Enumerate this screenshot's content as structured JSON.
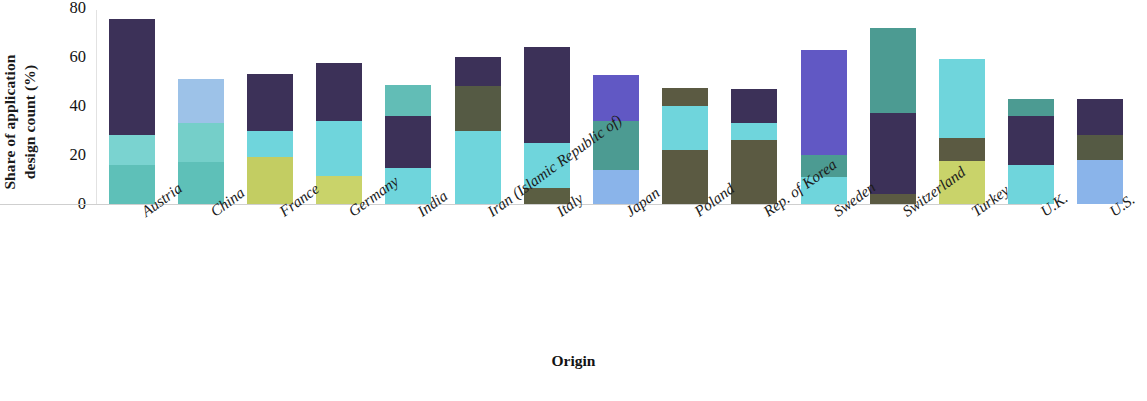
{
  "chart_data": {
    "type": "bar",
    "stacked": true,
    "title": "",
    "subtitle": "",
    "xlabel": "Origin",
    "ylabel": "Share of application design count (%)",
    "ylabel_line1": "Share of application",
    "ylabel_line2": "design count (%)",
    "ylim": [
      0,
      80
    ],
    "yticks": [
      0,
      20,
      40,
      60,
      80
    ],
    "ytick_labels": [
      "0",
      "20",
      "40",
      "60",
      "80"
    ],
    "grid": false,
    "legend": "none",
    "orientation": "vertical",
    "categories": [
      "Austria",
      "China",
      "France",
      "Germany",
      "India",
      "Iran (Islamic Republic of)",
      "Italy",
      "Japan",
      "Poland",
      "Rep. of Korea",
      "Sweden",
      "Switzerland",
      "Turkey",
      "U.K.",
      "U.S."
    ],
    "totals": [
      75.5,
      51.0,
      53.0,
      57.5,
      48.5,
      60.0,
      64.0,
      52.5,
      47.5,
      47.0,
      63.0,
      72.0,
      59.0,
      43.0,
      43.0
    ],
    "note": "Each origin shows three stacked class segments, listed bottom-to-top with their colors.",
    "bars": [
      {
        "category": "Austria",
        "total": 75.5,
        "segments": [
          {
            "value": 16.0,
            "color": "#5ec0b8",
            "order": "bottom"
          },
          {
            "value": 12.0,
            "color": "#7ad3d0",
            "order": "middle"
          },
          {
            "value": 47.5,
            "color": "#3c3158",
            "order": "top"
          }
        ]
      },
      {
        "category": "China",
        "total": 51.0,
        "segments": [
          {
            "value": 17.0,
            "color": "#5ec0b8",
            "order": "bottom"
          },
          {
            "value": 16.0,
            "color": "#75cfc9",
            "order": "middle"
          },
          {
            "value": 18.0,
            "color": "#9dc2e8",
            "order": "top"
          }
        ]
      },
      {
        "category": "France",
        "total": 53.0,
        "segments": [
          {
            "value": 19.0,
            "color": "#c3cd62",
            "order": "bottom"
          },
          {
            "value": 11.0,
            "color": "#6fd5dc",
            "order": "middle"
          },
          {
            "value": 23.0,
            "color": "#3c3158",
            "order": "top"
          }
        ]
      },
      {
        "category": "Germany",
        "total": 57.5,
        "segments": [
          {
            "value": 11.5,
            "color": "#c9d36a",
            "order": "bottom"
          },
          {
            "value": 22.5,
            "color": "#6fd5dc",
            "order": "middle"
          },
          {
            "value": 23.5,
            "color": "#3c3158",
            "order": "top"
          }
        ]
      },
      {
        "category": "India",
        "total": 48.5,
        "segments": [
          {
            "value": 14.5,
            "color": "#6fd5dc",
            "order": "bottom"
          },
          {
            "value": 21.5,
            "color": "#3c3158",
            "order": "middle"
          },
          {
            "value": 12.5,
            "color": "#62bdb6",
            "order": "top"
          }
        ]
      },
      {
        "category": "Iran (Islamic Republic of)",
        "total": 60.0,
        "segments": [
          {
            "value": 30.0,
            "color": "#6fd5dc",
            "order": "bottom"
          },
          {
            "value": 18.0,
            "color": "#555a44",
            "order": "middle"
          },
          {
            "value": 12.0,
            "color": "#3c3158",
            "order": "top"
          }
        ]
      },
      {
        "category": "Italy",
        "total": 64.0,
        "segments": [
          {
            "value": 6.5,
            "color": "#5b5e42",
            "order": "bottom"
          },
          {
            "value": 18.5,
            "color": "#6fd5dc",
            "order": "middle"
          },
          {
            "value": 39.0,
            "color": "#3c3158",
            "order": "top"
          }
        ]
      },
      {
        "category": "Japan",
        "total": 52.5,
        "segments": [
          {
            "value": 14.0,
            "color": "#8ab4ea",
            "order": "bottom"
          },
          {
            "value": 20.0,
            "color": "#4c9b92",
            "order": "middle"
          },
          {
            "value": 18.5,
            "color": "#6158c4",
            "order": "top"
          }
        ]
      },
      {
        "category": "Poland",
        "total": 47.5,
        "segments": [
          {
            "value": 22.0,
            "color": "#5b5a42",
            "order": "bottom"
          },
          {
            "value": 18.0,
            "color": "#6fd5dc",
            "order": "middle"
          },
          {
            "value": 7.5,
            "color": "#5b5a42",
            "order": "top"
          }
        ]
      },
      {
        "category": "Rep. of Korea",
        "total": 47.0,
        "segments": [
          {
            "value": 26.0,
            "color": "#5b5a42",
            "order": "bottom"
          },
          {
            "value": 7.0,
            "color": "#6fd5dc",
            "order": "middle"
          },
          {
            "value": 14.0,
            "color": "#3c3158",
            "order": "top"
          }
        ]
      },
      {
        "category": "Sweden",
        "total": 63.0,
        "segments": [
          {
            "value": 11.0,
            "color": "#6fd5dc",
            "order": "bottom"
          },
          {
            "value": 9.0,
            "color": "#4c9b92",
            "order": "middle"
          },
          {
            "value": 43.0,
            "color": "#6158c4",
            "order": "top"
          }
        ]
      },
      {
        "category": "Switzerland",
        "total": 72.0,
        "segments": [
          {
            "value": 4.0,
            "color": "#5b5a42",
            "order": "bottom"
          },
          {
            "value": 33.0,
            "color": "#3c3158",
            "order": "middle"
          },
          {
            "value": 35.0,
            "color": "#4c9b92",
            "order": "top"
          }
        ]
      },
      {
        "category": "Turkey",
        "total": 59.0,
        "segments": [
          {
            "value": 17.5,
            "color": "#c9d36a",
            "order": "bottom"
          },
          {
            "value": 9.5,
            "color": "#5b5a42",
            "order": "middle"
          },
          {
            "value": 32.0,
            "color": "#6fd5dc",
            "order": "top"
          }
        ]
      },
      {
        "category": "U.K.",
        "total": 43.0,
        "segments": [
          {
            "value": 16.0,
            "color": "#6fd5dc",
            "order": "bottom"
          },
          {
            "value": 20.0,
            "color": "#3c3158",
            "order": "middle"
          },
          {
            "value": 7.0,
            "color": "#4c9b92",
            "order": "top"
          }
        ]
      },
      {
        "category": "U.S.",
        "total": 43.0,
        "segments": [
          {
            "value": 18.0,
            "color": "#8ab4ea",
            "order": "bottom"
          },
          {
            "value": 10.0,
            "color": "#555a44",
            "order": "middle"
          },
          {
            "value": 15.0,
            "color": "#3c3158",
            "order": "top"
          }
        ]
      }
    ]
  }
}
